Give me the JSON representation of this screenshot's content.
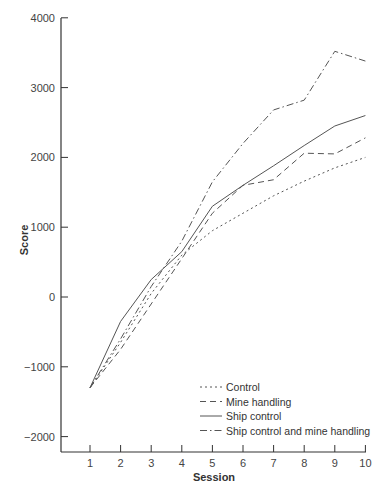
{
  "chart_data": {
    "type": "line",
    "title": "",
    "xlabel": "Session",
    "ylabel": "Score",
    "x": [
      1,
      2,
      3,
      4,
      5,
      6,
      7,
      8,
      9,
      10
    ],
    "ylim": [
      -2200,
      4000
    ],
    "yticks": [
      -2000,
      -1000,
      0,
      1000,
      2000,
      3000,
      4000
    ],
    "ytick_labels": [
      "−2000",
      "−1000",
      "0",
      "1000",
      "2000",
      "3000",
      "4000"
    ],
    "xticks": [
      1,
      2,
      3,
      4,
      5,
      6,
      7,
      8,
      9,
      10
    ],
    "grid": false,
    "legend_position": "lower right",
    "series": [
      {
        "name": "Control",
        "style": "dotted",
        "values": [
          -1300,
          -650,
          50,
          600,
          950,
          1200,
          1450,
          1660,
          1850,
          2000
        ]
      },
      {
        "name": "Mine handling",
        "style": "dashed",
        "values": [
          -1300,
          -750,
          -100,
          550,
          1200,
          1600,
          1680,
          2060,
          2050,
          2280
        ]
      },
      {
        "name": "Ship control",
        "style": "solid",
        "values": [
          -1300,
          -350,
          250,
          650,
          1300,
          1600,
          1880,
          2170,
          2450,
          2600
        ]
      },
      {
        "name": "Ship control and mine handling",
        "style": "dashdot",
        "values": [
          -1300,
          -600,
          150,
          800,
          1650,
          2200,
          2680,
          2820,
          3520,
          3380
        ]
      }
    ]
  },
  "colors": {
    "line": "#555555",
    "axis": "#333333"
  }
}
